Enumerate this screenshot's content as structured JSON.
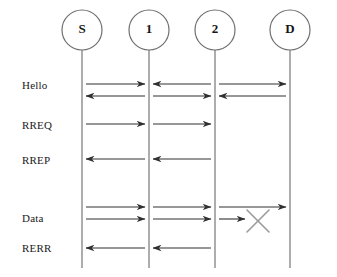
{
  "diagram": {
    "type": "sequence-diagram",
    "title": "",
    "width": 337,
    "height": 277,
    "background_color": "#ffffff",
    "line_color": "#8a8a8a",
    "arrow_color": "#303030",
    "break_color": "#9a9a9a",
    "nodes": [
      {
        "id": "S",
        "label": "S",
        "x": 82,
        "y": 30,
        "r": 20,
        "lifeline_bottom": 268
      },
      {
        "id": "1",
        "label": "1",
        "x": 149,
        "y": 30,
        "r": 20,
        "lifeline_bottom": 268
      },
      {
        "id": "2",
        "label": "2",
        "x": 215,
        "y": 30,
        "r": 20,
        "lifeline_bottom": 268
      },
      {
        "id": "D",
        "label": "D",
        "x": 290,
        "y": 30,
        "r": 20,
        "lifeline_bottom": 268
      }
    ],
    "row_labels": [
      {
        "id": "hello",
        "text": "Hello",
        "x": 22,
        "y": 86
      },
      {
        "id": "rreq",
        "text": "RREQ",
        "x": 22,
        "y": 126
      },
      {
        "id": "rrep",
        "text": "RREP",
        "x": 22,
        "y": 161
      },
      {
        "id": "data",
        "text": "Data",
        "x": 22,
        "y": 219
      },
      {
        "id": "rerr",
        "text": "RERR",
        "x": 22,
        "y": 249
      }
    ],
    "messages": [
      {
        "id": "hello-s-to-1",
        "group": "hello",
        "from": "S",
        "to": "1",
        "direction": "right",
        "y": 84,
        "x1": 86,
        "x2": 145
      },
      {
        "id": "hello-2-to-1",
        "group": "hello",
        "from": "2",
        "to": "1",
        "direction": "left",
        "y": 84,
        "x1": 153,
        "x2": 211
      },
      {
        "id": "hello-2-to-d",
        "group": "hello",
        "from": "2",
        "to": "D",
        "direction": "right",
        "y": 84,
        "x1": 219,
        "x2": 286
      },
      {
        "id": "hello-1-to-s",
        "group": "hello",
        "from": "1",
        "to": "S",
        "direction": "left",
        "y": 96,
        "x1": 86,
        "x2": 145
      },
      {
        "id": "hello-1-to-2",
        "group": "hello",
        "from": "1",
        "to": "2",
        "direction": "right",
        "y": 96,
        "x1": 153,
        "x2": 211
      },
      {
        "id": "hello-d-to-2",
        "group": "hello",
        "from": "D",
        "to": "2",
        "direction": "left",
        "y": 96,
        "x1": 219,
        "x2": 286
      },
      {
        "id": "rreq-s-to-1",
        "group": "rreq",
        "from": "S",
        "to": "1",
        "direction": "right",
        "y": 124,
        "x1": 86,
        "x2": 145
      },
      {
        "id": "rreq-1-to-2",
        "group": "rreq",
        "from": "1",
        "to": "2",
        "direction": "right",
        "y": 124,
        "x1": 153,
        "x2": 211
      },
      {
        "id": "rrep-1-to-s",
        "group": "rrep",
        "from": "1",
        "to": "S",
        "direction": "left",
        "y": 159,
        "x1": 86,
        "x2": 145
      },
      {
        "id": "rrep-2-to-1",
        "group": "rrep",
        "from": "2",
        "to": "1",
        "direction": "left",
        "y": 159,
        "x1": 153,
        "x2": 211
      },
      {
        "id": "data1-s-to-1",
        "group": "data",
        "from": "S",
        "to": "1",
        "direction": "right",
        "y": 207,
        "x1": 86,
        "x2": 145
      },
      {
        "id": "data1-1-to-2",
        "group": "data",
        "from": "1",
        "to": "2",
        "direction": "right",
        "y": 207,
        "x1": 153,
        "x2": 211
      },
      {
        "id": "data1-2-to-d",
        "group": "data",
        "from": "2",
        "to": "D",
        "direction": "right",
        "y": 207,
        "x1": 219,
        "x2": 286
      },
      {
        "id": "data2-s-to-1",
        "group": "data",
        "from": "S",
        "to": "1",
        "direction": "right",
        "y": 219,
        "x1": 86,
        "x2": 145
      },
      {
        "id": "data2-1-to-2",
        "group": "data",
        "from": "1",
        "to": "2",
        "direction": "right",
        "y": 219,
        "x1": 153,
        "x2": 211
      },
      {
        "id": "data2-2-to-x",
        "group": "data",
        "from": "2",
        "to": "break",
        "direction": "right",
        "y": 219,
        "x1": 219,
        "x2": 245
      },
      {
        "id": "rerr-1-to-s",
        "group": "rerr",
        "from": "1",
        "to": "S",
        "direction": "left",
        "y": 248,
        "x1": 86,
        "x2": 145
      },
      {
        "id": "rerr-2-to-1",
        "group": "rerr",
        "from": "2",
        "to": "1",
        "direction": "left",
        "y": 248,
        "x1": 153,
        "x2": 211
      }
    ],
    "break_marks": [
      {
        "id": "link-failure-x",
        "cx": 258,
        "cy": 221,
        "size": 11
      }
    ]
  }
}
